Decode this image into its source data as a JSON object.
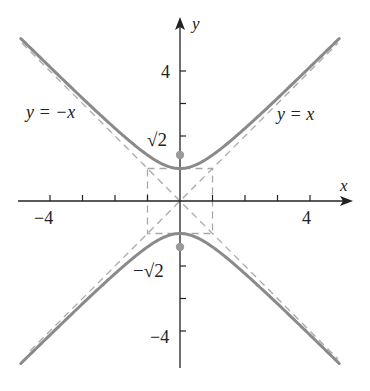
{
  "figure": {
    "equation": "y^2 - x^2 = 1",
    "axes": {
      "x_label": "x",
      "y_label": "y",
      "x_range": [
        -5,
        5.3
      ],
      "y_range": [
        -5.2,
        5.6
      ],
      "x_ticks": [
        -4,
        -3,
        -2,
        -1,
        1,
        2,
        3,
        4
      ],
      "y_ticks": [
        -4,
        -3,
        -2,
        -1,
        1,
        2,
        3,
        4
      ],
      "x_tick_labels": [
        {
          "value": -4,
          "text": "−4"
        },
        {
          "value": 4,
          "text": "4"
        }
      ],
      "y_tick_labels": [
        {
          "value": 4,
          "text": "4"
        },
        {
          "value": -4,
          "text": "−4"
        }
      ]
    },
    "asymptotes": [
      {
        "equation": "y = x",
        "label": "y = x",
        "slope": 1
      },
      {
        "equation": "y = -x",
        "label": "y = −x",
        "slope": -1
      }
    ],
    "focus_labels": [
      {
        "text": "√2",
        "y": 1.4142
      },
      {
        "text": "−√2",
        "y": -1.4142
      }
    ],
    "foci": [
      [
        0,
        1.4142
      ],
      [
        0,
        -1.4142
      ]
    ],
    "vertices": [
      [
        0,
        1
      ],
      [
        0,
        -1
      ]
    ],
    "central_box": {
      "x": [
        -1,
        1
      ],
      "y": [
        -1,
        1
      ]
    },
    "colors": {
      "axis": "#222222",
      "curve": "#8a8a8a",
      "asymptote": "#a8a8a8",
      "focus_dot": "#9a9a9a",
      "text": "#222222"
    }
  }
}
